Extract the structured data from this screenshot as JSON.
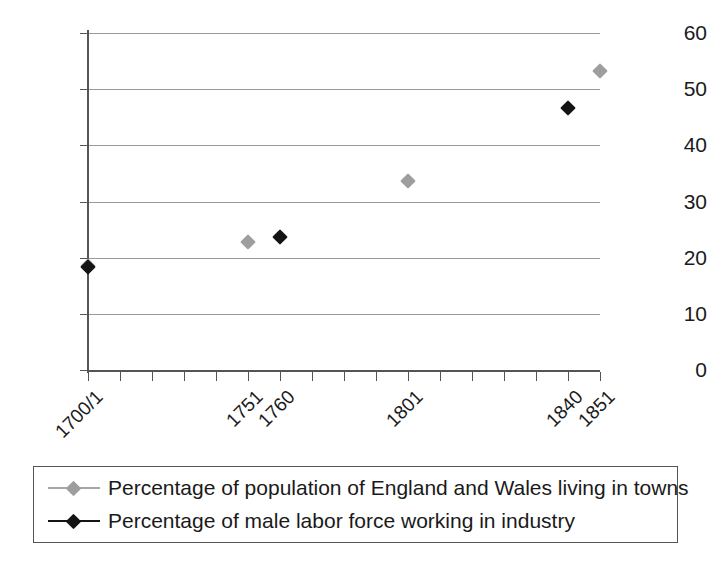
{
  "chart_data": {
    "type": "scatter",
    "title": "",
    "subtitle": "",
    "xlabel": "",
    "ylabel": "",
    "ylim": [
      0,
      60
    ],
    "ytick_values": [
      0,
      10,
      20,
      30,
      40,
      50,
      60
    ],
    "ytick_labels": [
      "0",
      "10",
      "20",
      "30",
      "40",
      "50",
      "60"
    ],
    "grid": true,
    "grid_axis": "y",
    "x_tick_count": 17,
    "categories": [
      "1700/1",
      "1751",
      "1760",
      "1801",
      "1840",
      "1851"
    ],
    "xtick_labels": [
      "1700/1",
      "1751",
      "1760",
      "1801",
      "1840",
      "1851"
    ],
    "xtick_label_rotation": -45,
    "legend_position": "bottom",
    "series": [
      {
        "name": "Percentage of population of England and Wales living in towns",
        "color": "#9e9e9e",
        "marker": "diamond",
        "points": [
          {
            "x": "1700/1",
            "y": 18.5
          },
          {
            "x": "1751",
            "y": 22.8
          },
          {
            "x": "1801",
            "y": 33.7
          },
          {
            "x": "1851",
            "y": 53.3
          }
        ]
      },
      {
        "name": "Percentage of male labor force working in industry",
        "color": "#141414",
        "marker": "diamond",
        "points": [
          {
            "x": "1700/1",
            "y": 18.3
          },
          {
            "x": "1760",
            "y": 23.6
          },
          {
            "x": "1840",
            "y": 46.7
          }
        ]
      }
    ]
  },
  "legend": {
    "entries": [
      {
        "label": "Percentage of population of England and Wales living in towns",
        "color": "#9e9e9e"
      },
      {
        "label": "Percentage of male labor force working in industry",
        "color": "#141414"
      }
    ]
  },
  "colors": {
    "series_towns": "#9e9e9e",
    "series_industry": "#141414",
    "gridline": "#9a9a9a",
    "axis": "#555555",
    "text": "#1a1a1a",
    "background": "#ffffff"
  }
}
